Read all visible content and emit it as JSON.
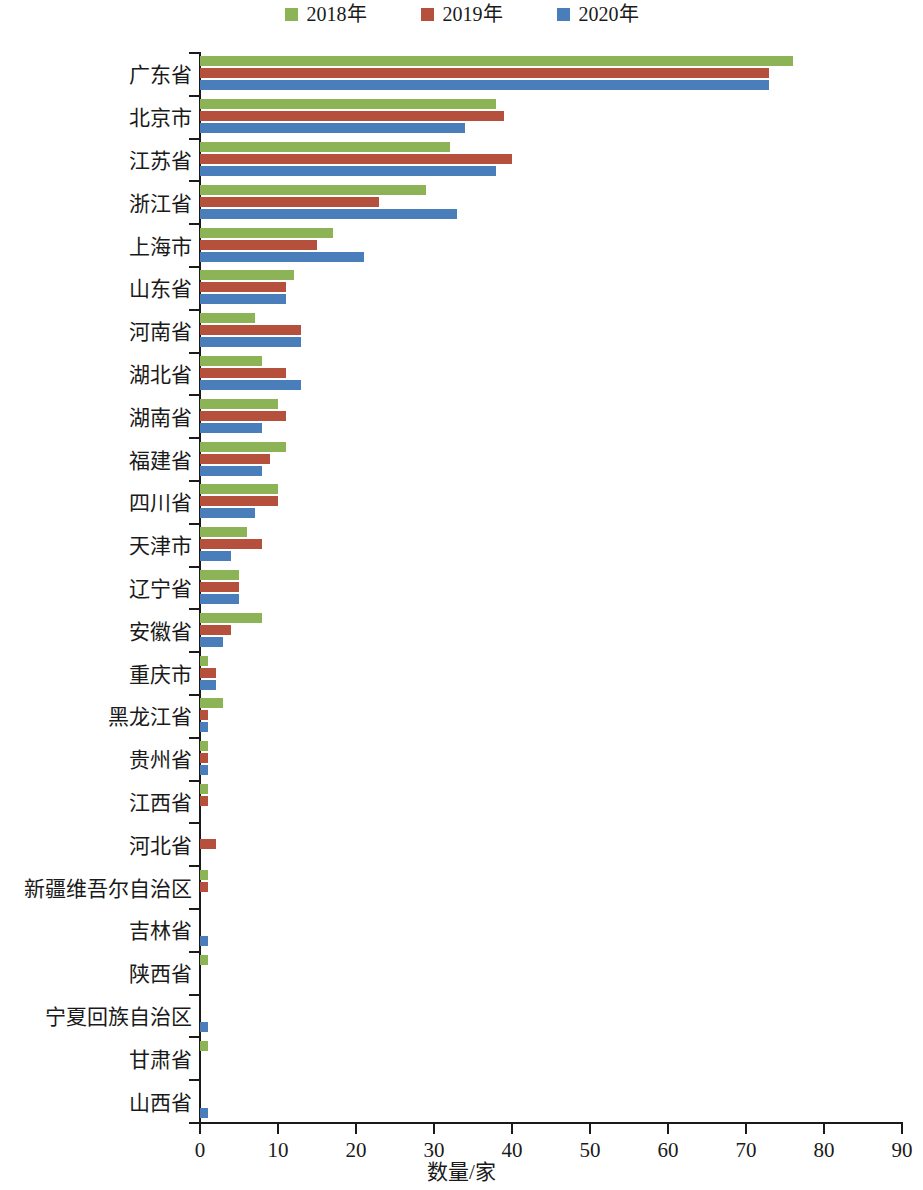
{
  "chart_data": {
    "type": "bar",
    "orientation": "horizontal",
    "title": "",
    "xlabel": "数量/家",
    "ylabel": "",
    "xlim": [
      0,
      90
    ],
    "xticks": [
      0,
      10,
      20,
      30,
      40,
      50,
      60,
      70,
      80,
      90
    ],
    "grid": false,
    "legend_position": "top-center",
    "categories": [
      "广东省",
      "北京市",
      "江苏省",
      "浙江省",
      "上海市",
      "山东省",
      "河南省",
      "湖北省",
      "湖南省",
      "福建省",
      "四川省",
      "天津市",
      "辽宁省",
      "安徽省",
      "重庆市",
      "黑龙江省",
      "贵州省",
      "江西省",
      "河北省",
      "新疆维吾尔自治区",
      "吉林省",
      "陕西省",
      "宁夏回族自治区",
      "甘肃省",
      "山西省"
    ],
    "series": [
      {
        "name": "2018年",
        "color": "#8CB457",
        "values": [
          76,
          38,
          32,
          29,
          17,
          12,
          7,
          8,
          10,
          11,
          10,
          6,
          5,
          8,
          1,
          3,
          1,
          1,
          0,
          1,
          0,
          1,
          0,
          1,
          0
        ]
      },
      {
        "name": "2019年",
        "color": "#B5503C",
        "values": [
          73,
          39,
          40,
          23,
          15,
          11,
          13,
          11,
          11,
          9,
          10,
          8,
          5,
          4,
          2,
          1,
          1,
          1,
          2,
          1,
          0,
          0,
          0,
          0,
          0
        ]
      },
      {
        "name": "2020年",
        "color": "#4A7EBB",
        "values": [
          73,
          34,
          38,
          33,
          21,
          11,
          13,
          13,
          8,
          8,
          7,
          4,
          5,
          3,
          2,
          1,
          1,
          0,
          0,
          0,
          1,
          0,
          1,
          0,
          1
        ]
      }
    ]
  },
  "legend": {
    "items": [
      {
        "label": "2018年",
        "color": "#8CB457"
      },
      {
        "label": "2019年",
        "color": "#B5503C"
      },
      {
        "label": "2020年",
        "color": "#4A7EBB"
      }
    ]
  },
  "axis": {
    "x_title": "数量/家",
    "x_tick_labels": [
      "0",
      "10",
      "20",
      "30",
      "40",
      "50",
      "60",
      "70",
      "80",
      "90"
    ]
  }
}
